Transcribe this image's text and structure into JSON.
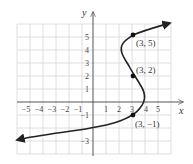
{
  "axes": {
    "x_label": "x",
    "y_label": "y",
    "x_ticks": [
      "−5",
      "−4",
      "−3",
      "−2",
      "−1",
      "1",
      "2",
      "3",
      "4",
      "5"
    ],
    "y_ticks": [
      "5",
      "4",
      "3",
      "2",
      "1",
      "−1",
      "−3"
    ]
  },
  "points": [
    {
      "label": "(3, 5)",
      "x": 3,
      "y": 5
    },
    {
      "label": "(3, 2)",
      "x": 3,
      "y": 2
    },
    {
      "label": "(3, −1)",
      "x": 3,
      "y": -1
    }
  ],
  "colors": {
    "grid": "#d6d6d6",
    "curve": "#222222",
    "axis": "#555555"
  }
}
